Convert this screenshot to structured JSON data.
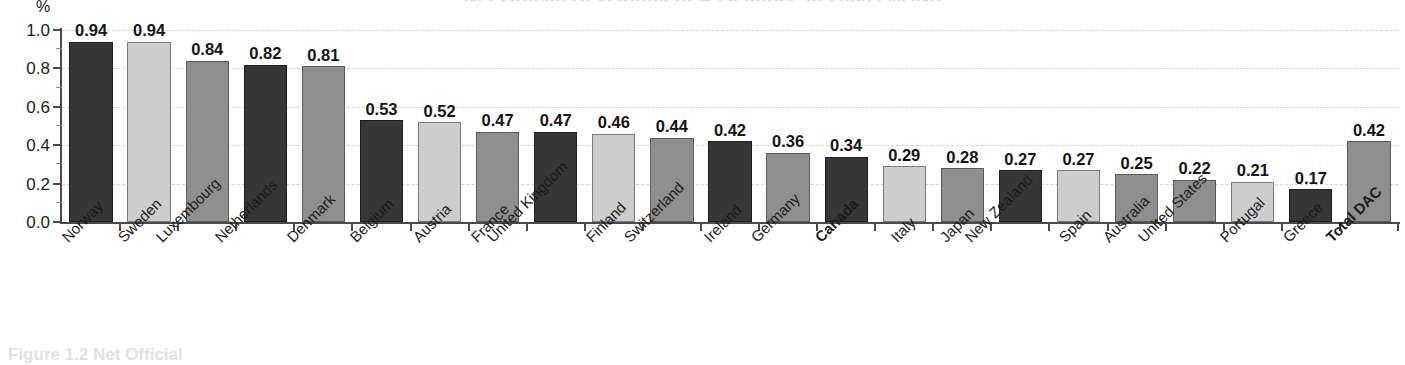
{
  "chart_data": {
    "type": "bar",
    "title": "",
    "xlabel": "",
    "ylabel": "%",
    "ylim": [
      0.0,
      1.0
    ],
    "yticks": [
      "0.0",
      "0.2",
      "0.4",
      "0.6",
      "0.8",
      "1.0"
    ],
    "ytick_values": [
      0.0,
      0.2,
      0.4,
      0.6,
      0.8,
      1.0
    ],
    "grid": true,
    "legend": "none",
    "categories": [
      "Norway",
      "Sweden",
      "Luxembourg",
      "Netherlands",
      "Denmark",
      "Belgium",
      "Austria",
      "France",
      "United Kingdom",
      "Finland",
      "Switzerland",
      "Ireland",
      "Germany",
      "Canada",
      "Italy",
      "Japan",
      "New Zealand",
      "Spain",
      "Australia",
      "United States",
      "Portugal",
      "Greece",
      "Total DAC"
    ],
    "values": [
      0.94,
      0.94,
      0.84,
      0.82,
      0.81,
      0.53,
      0.52,
      0.47,
      0.47,
      0.46,
      0.44,
      0.42,
      0.36,
      0.34,
      0.29,
      0.28,
      0.27,
      0.27,
      0.25,
      0.22,
      0.21,
      0.17,
      0.42
    ],
    "data_labels": [
      "0.94",
      "0.94",
      "0.84",
      "0.82",
      "0.81",
      "0.53",
      "0.52",
      "0.47",
      "0.47",
      "0.46",
      "0.44",
      "0.42",
      "0.36",
      "0.34",
      "0.29",
      "0.28",
      "0.27",
      "0.27",
      "0.25",
      "0.22",
      "0.21",
      "0.17",
      "0.42"
    ],
    "bar_shades": [
      "dark",
      "light",
      "medium",
      "dark",
      "medium",
      "dark",
      "light",
      "medium",
      "dark",
      "light",
      "medium",
      "dark",
      "medium",
      "dark",
      "light",
      "medium",
      "dark",
      "light",
      "medium",
      "medium",
      "light",
      "dark",
      "medium"
    ],
    "emphasized_categories": [
      "Canada",
      "Total DAC"
    ],
    "colors": {
      "dark": "#363636",
      "light": "#cdcdcd",
      "medium": "#8f8f8f",
      "axis": "#4a4a4a",
      "grid": "#d2d2d2",
      "text": "#1c1c1c"
    }
  },
  "axis": {
    "percent_symbol": "%"
  },
  "clipped": {
    "title_remnant": "Net Official Development Assistance in 2005 (%GNI)",
    "footer_remnant": "Figure 1.2  Net Official"
  }
}
